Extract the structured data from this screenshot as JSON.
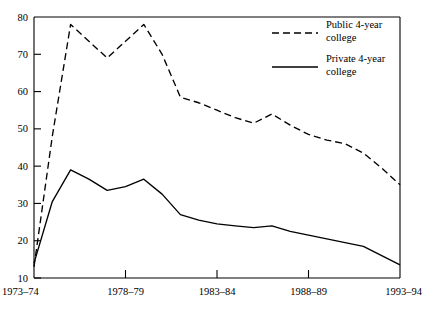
{
  "chart_data": {
    "type": "line",
    "title": "",
    "xlabel": "",
    "ylabel": "",
    "ylim": [
      10,
      80
    ],
    "yticks": [
      10,
      20,
      30,
      40,
      50,
      60,
      70,
      80
    ],
    "ytick_labels": [
      "10",
      "20",
      "30",
      "40",
      "50",
      "60",
      "70",
      "80"
    ],
    "grid": false,
    "legend_position": "top-right",
    "x": [
      "1973-74",
      "1974-75",
      "1975-76",
      "1976-77",
      "1977-78",
      "1978-79",
      "1979-80",
      "1980-81",
      "1981-82",
      "1982-83",
      "1983-84",
      "1984-85",
      "1985-86",
      "1986-87",
      "1987-88",
      "1988-89",
      "1989-90",
      "1990-91",
      "1991-92",
      "1992-93",
      "1993-94"
    ],
    "xtick_labels": [
      "1973–74",
      "1978–79",
      "1983–84",
      "1988–89",
      "1993–94"
    ],
    "xtick_indices": [
      0,
      5,
      10,
      15,
      20
    ],
    "series": [
      {
        "name": "Public 4-year college",
        "style": "dashed",
        "color": "#000000",
        "values": [
          13,
          48,
          78,
          73.5,
          69,
          73.5,
          78,
          70,
          58.5,
          57,
          55,
          53,
          51.5,
          54,
          51,
          48.5,
          47,
          46,
          43.5,
          39.5,
          35
        ]
      },
      {
        "name": "Private 4-year college",
        "style": "solid",
        "color": "#000000",
        "values": [
          14,
          30.5,
          39,
          36.5,
          33.5,
          34.5,
          36.5,
          32.5,
          27,
          25.5,
          24.5,
          24,
          23.5,
          24,
          22.5,
          21.5,
          20.5,
          19.5,
          18.5,
          16,
          13.5
        ]
      }
    ]
  },
  "legend": {
    "items": [
      {
        "label_line1": "Public 4-year",
        "label_line2": "college",
        "style": "dashed"
      },
      {
        "label_line1": "Private 4-year",
        "label_line2": "college",
        "style": "solid"
      }
    ]
  }
}
